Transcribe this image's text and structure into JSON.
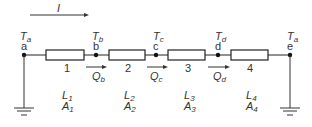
{
  "current": {
    "symbol": "I"
  },
  "nodes": [
    {
      "id": "a",
      "temp_main": "T",
      "temp_sub": "a",
      "x": 24
    },
    {
      "id": "b",
      "temp_main": "T",
      "temp_sub": "b",
      "x": 96
    },
    {
      "id": "c",
      "temp_main": "T",
      "temp_sub": "c",
      "x": 156
    },
    {
      "id": "d",
      "temp_main": "T",
      "temp_sub": "d",
      "x": 218
    },
    {
      "id": "e",
      "temp_main": "T",
      "temp_sub": "a",
      "x": 290
    }
  ],
  "segments": [
    {
      "number": "1",
      "L_main": "L",
      "L_sub": "1",
      "A_main": "A",
      "A_sub": "1"
    },
    {
      "number": "2",
      "L_main": "L",
      "L_sub": "2",
      "A_main": "A",
      "A_sub": "2"
    },
    {
      "number": "3",
      "L_main": "L",
      "L_sub": "3",
      "A_main": "A",
      "A_sub": "3"
    },
    {
      "number": "4",
      "L_main": "L",
      "L_sub": "4",
      "A_main": "A",
      "A_sub": "4"
    }
  ],
  "heat_flows": [
    {
      "main": "Q",
      "sub": "b"
    },
    {
      "main": "Q",
      "sub": "c"
    },
    {
      "main": "Q",
      "sub": "d"
    }
  ],
  "colors": {
    "line": "#222222",
    "text": "#333333"
  }
}
